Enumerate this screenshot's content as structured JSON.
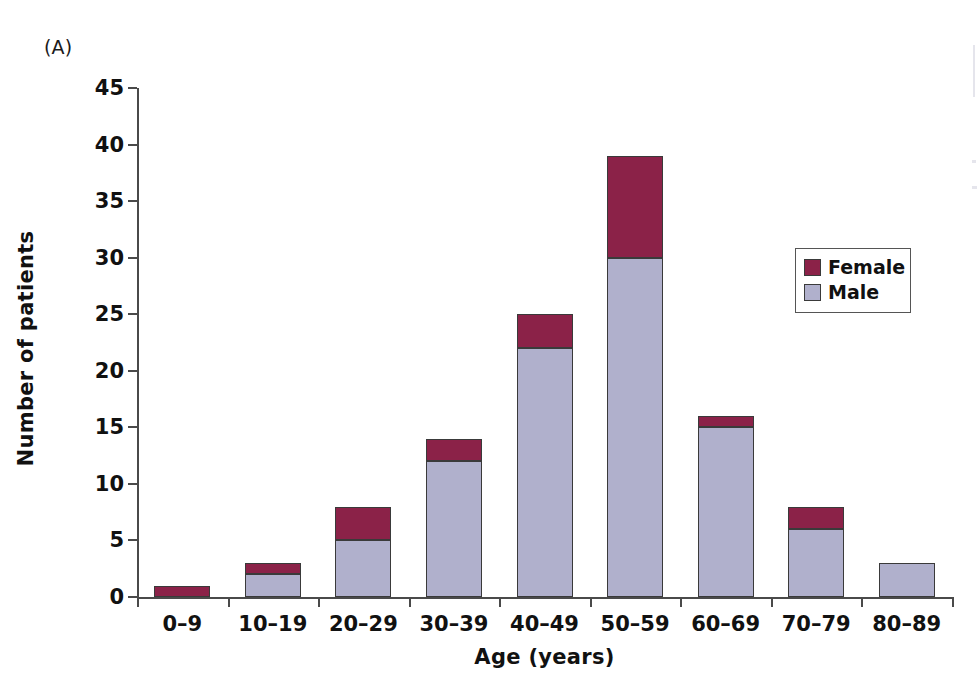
{
  "panel": {
    "label": "(A)"
  },
  "chart_data": {
    "type": "bar",
    "title": "",
    "subtitle": "",
    "xlabel": "Age (years)",
    "ylabel": "Number of patients",
    "categories": [
      "0–9",
      "10–19",
      "20–29",
      "30–39",
      "40–49",
      "50–59",
      "60–69",
      "70–79",
      "80–89"
    ],
    "series": [
      {
        "name": "Male",
        "color": "#b0b0cc",
        "values": [
          0,
          2,
          5,
          12,
          22,
          30,
          15,
          6,
          3
        ]
      },
      {
        "name": "Female",
        "color": "#8b2248",
        "values": [
          1,
          1,
          3,
          2,
          3,
          9,
          1,
          2,
          0
        ]
      }
    ],
    "totals": [
      1,
      3,
      8,
      14,
      25,
      39,
      16,
      8,
      3
    ],
    "stacked": true,
    "stack_order": [
      "Male",
      "Female"
    ],
    "ylim": [
      0,
      45
    ],
    "yticks": [
      0,
      5,
      10,
      15,
      20,
      25,
      30,
      35,
      40,
      45
    ],
    "ytick_labels": [
      "0",
      "5",
      "10",
      "15",
      "20",
      "25",
      "30",
      "35",
      "40",
      "45"
    ],
    "grid": false,
    "legend_position": "upper right",
    "legend_entries": [
      "Female",
      "Male"
    ]
  }
}
